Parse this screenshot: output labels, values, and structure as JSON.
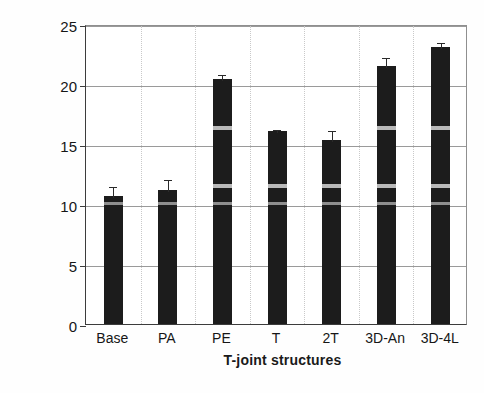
{
  "chart_data": {
    "type": "bar",
    "title": "",
    "xlabel": "T-joint structures",
    "ylabel": "Strength (MPa)",
    "categories": [
      "Base",
      "PA",
      "PE",
      "T",
      "2T",
      "3D-An",
      "3D-4L"
    ],
    "values": [
      10.7,
      11.2,
      20.4,
      16.1,
      15.3,
      21.5,
      23.1
    ],
    "errors": [
      0.85,
      0.95,
      0.55,
      0.25,
      0.95,
      0.8,
      0.5
    ],
    "ylim": [
      0,
      25
    ],
    "yticks": [
      0,
      5,
      10,
      15,
      20,
      25
    ],
    "ytick_labels": [
      "0",
      "5",
      "10",
      "15",
      "20",
      "25"
    ],
    "grid": "horizontal-solid-vertical-dotted",
    "legend": "none",
    "bar_color": "#1c1c1c",
    "stripe_color": "#b9b9b9",
    "stripes": {
      "note": "light horizontal bands visible inside taller bars",
      "levels_mpa": [
        16.5,
        11.7,
        10.2
      ]
    }
  },
  "axis": {
    "y_title": "Strength (MPa)",
    "x_title": "T-joint structures"
  }
}
